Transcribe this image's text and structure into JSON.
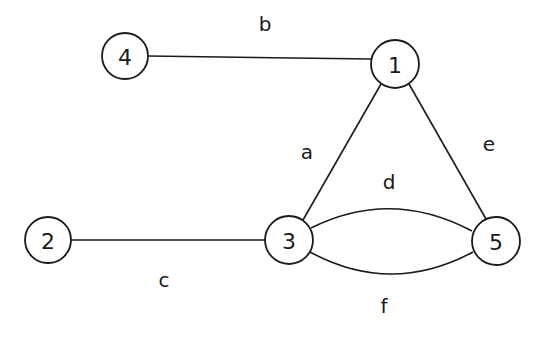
{
  "graph": {
    "nodes": [
      {
        "id": "1",
        "label": "1",
        "x": 395,
        "y": 64
      },
      {
        "id": "2",
        "label": "2",
        "x": 48,
        "y": 240
      },
      {
        "id": "3",
        "label": "3",
        "x": 289,
        "y": 240
      },
      {
        "id": "4",
        "label": "4",
        "x": 125,
        "y": 56
      },
      {
        "id": "5",
        "label": "5",
        "x": 496,
        "y": 241
      }
    ],
    "edges": [
      {
        "id": "a",
        "label": "a",
        "from": "3",
        "to": "1",
        "label_x": 307,
        "label_y": 152
      },
      {
        "id": "b",
        "label": "b",
        "from": "4",
        "to": "1",
        "label_x": 265,
        "label_y": 24
      },
      {
        "id": "c",
        "label": "c",
        "from": "2",
        "to": "3",
        "label_x": 164,
        "label_y": 280
      },
      {
        "id": "d",
        "label": "d",
        "from": "3",
        "to": "5",
        "label_x": 389,
        "label_y": 182
      },
      {
        "id": "e",
        "label": "e",
        "from": "1",
        "to": "5",
        "label_x": 489,
        "label_y": 144
      },
      {
        "id": "f",
        "label": "f",
        "from": "3",
        "to": "5",
        "label_x": 384,
        "label_y": 306
      }
    ]
  }
}
